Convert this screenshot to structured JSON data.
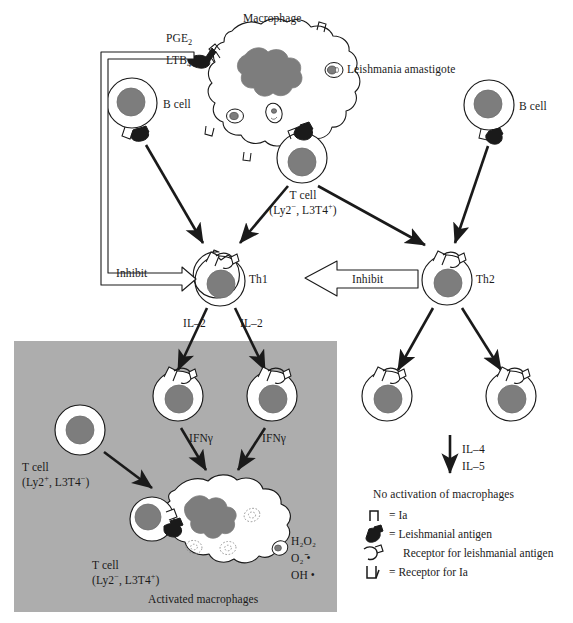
{
  "figure": {
    "title": "Macrophage",
    "background": "#ffffff",
    "colors": {
      "nucleus_gray": "#7d7d7d",
      "panel_gray": "#adadad",
      "outline": "#1a1a1a",
      "cell_fill": "#ffffff"
    }
  },
  "top": {
    "macrophage_label": "Macrophage",
    "mediator_1": "PGE",
    "mediator_1_sub": "2",
    "mediator_2": "LTB",
    "mediator_2_sub": "4",
    "parasite_label": "Leishmania amastigote",
    "b_cell_left": "B cell",
    "b_cell_right": "B cell"
  },
  "tcell_source": {
    "line1": "T cell",
    "line2_pre": "(Ly2",
    "line2_sup1": "−",
    "line2_mid": ", L3T4",
    "line2_sup2": "+",
    "line2_post": ")"
  },
  "helper": {
    "th1_label": "Th1",
    "th2_label": "Th2",
    "inhibit_left": "Inhibit",
    "inhibit_right": "Inhibit",
    "il2_left": "IL–2",
    "il2_right": "IL–2"
  },
  "activation_panel": {
    "caption": "Activated macrophages",
    "ifn_left": "IFNγ",
    "ifn_right": "IFNγ",
    "cytotoxic_tcell": {
      "line1": "T cell",
      "line2_pre": "(Ly2",
      "line2_sup1": "+",
      "line2_mid": ", L3T4",
      "line2_sup2": "−",
      "line2_post": ")"
    },
    "helper_tcell": {
      "line1": "T cell",
      "line2_pre": "(Ly2",
      "line2_sup1": "−",
      "line2_mid": ", L3T4",
      "line2_sup2": "+",
      "line2_post": ")"
    },
    "radicals": [
      {
        "base": "H",
        "sub1": "2",
        "mid": "O",
        "sub2": "2",
        "tail": ""
      },
      {
        "base": "O",
        "sub1": "2",
        "mid": "",
        "sub2": "",
        "tail": " ⁻̇"
      },
      {
        "base": "OH",
        "sub1": "",
        "mid": "",
        "sub2": "",
        "tail": " •"
      }
    ],
    "radical_1": "H₂O₂",
    "radical_2": "O₂ ̄•",
    "radical_3": "OH •"
  },
  "th2_branch": {
    "il4": "IL–4",
    "il5": "IL–5",
    "outcome": "No activation of macrophages"
  },
  "legend": {
    "items": [
      {
        "icon": "ia-glyph-icon",
        "eq": "=",
        "label": "Ia"
      },
      {
        "icon": "leishmanial-antigen-icon",
        "eq": "=",
        "label": "Leishmanial antigen"
      },
      {
        "icon": "antigen-receptor-icon",
        "eq": "",
        "label": "Receptor for leishmanial antigen"
      },
      {
        "icon": "ia-receptor-icon",
        "eq": "=",
        "label": "Receptor for Ia"
      }
    ]
  }
}
